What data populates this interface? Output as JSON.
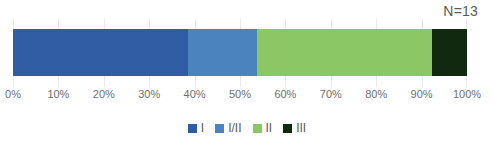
{
  "chart_data": {
    "type": "bar",
    "orientation": "horizontal",
    "stacked": true,
    "title": "",
    "subtitle": "",
    "xlabel": "",
    "ylabel": "",
    "annotation": "N=13",
    "xlim": [
      0,
      100
    ],
    "grid": true,
    "legend_position": "bottom",
    "categories": [
      ""
    ],
    "tick_labels": [
      "0%",
      "10%",
      "20%",
      "30%",
      "40%",
      "50%",
      "60%",
      "70%",
      "80%",
      "90%",
      "100%"
    ],
    "tick_values": [
      0,
      10,
      20,
      30,
      40,
      50,
      60,
      70,
      80,
      90,
      100
    ],
    "series": [
      {
        "name": "I",
        "values": [
          38.5
        ],
        "color": "#305CA4",
        "count": 5
      },
      {
        "name": "I/II",
        "values": [
          15.4
        ],
        "color": "#4A83BE",
        "count": 2
      },
      {
        "name": "II",
        "values": [
          38.5
        ],
        "color": "#8CC765",
        "count": 5
      },
      {
        "name": "III",
        "values": [
          7.7
        ],
        "color": "#11290F",
        "count": 1
      }
    ],
    "cumulative_boundaries": [
      38.5,
      53.8,
      92.3,
      100.0
    ],
    "total_n": 13,
    "axis_color": "#E9E9EC",
    "text_color": "#6E6E6E",
    "background": "#FFFFFF"
  },
  "annotation": {
    "n_label": "N=13"
  },
  "legend": {
    "items": [
      {
        "label": "I",
        "color": "#305CA4"
      },
      {
        "label": "I/II",
        "color": "#4A83BE"
      },
      {
        "label": "II",
        "color": "#8CC765"
      },
      {
        "label": "III",
        "color": "#11290F"
      }
    ]
  }
}
